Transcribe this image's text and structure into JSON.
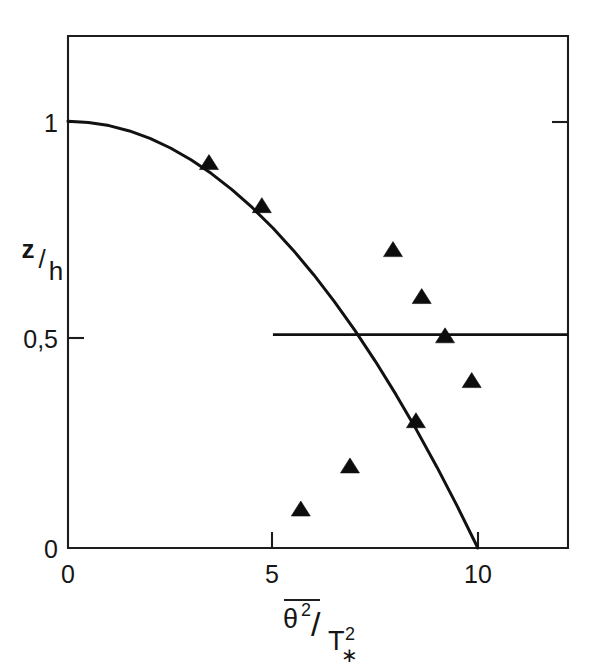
{
  "figure": {
    "background_color": "#ffffff",
    "ink_color": "#111111",
    "frame": {
      "left_px": 68,
      "right_px": 568,
      "top_px": 36,
      "bottom_px": 548
    }
  },
  "axes": {
    "y": {
      "label_numerator": "z",
      "label_slash": "/",
      "label_denominator": "h",
      "tick_labels": [
        "1",
        "0,5",
        "0"
      ],
      "tick_values": [
        1,
        0.5,
        0
      ],
      "range": [
        0,
        1.2
      ]
    },
    "x": {
      "label_numerator": "θ",
      "label_numerator_exponent": "2",
      "label_slash": "/",
      "label_denominator": "T",
      "label_denominator_subscript": "∗",
      "label_denominator_exponent": "2",
      "label_overbar": true,
      "tick_labels": [
        "0",
        "5",
        "10"
      ],
      "tick_values": [
        0,
        5,
        10
      ],
      "range": [
        0,
        12.2
      ]
    }
  },
  "chart_data": {
    "type": "scatter",
    "title": "",
    "subtitle": "",
    "xlabel": "θ̅² / T∗²",
    "ylabel": "z/h",
    "xlim": [
      0,
      12.2
    ],
    "ylim": [
      0,
      1.2
    ],
    "xticks": [
      0,
      5,
      10
    ],
    "xticklabels": [
      "0",
      "5",
      "10"
    ],
    "yticks": [
      0,
      0.5,
      1
    ],
    "yticklabels": [
      "0",
      "0,5",
      "1"
    ],
    "grid": false,
    "legend": "none",
    "series": [
      {
        "name": "measurements",
        "type": "scatter",
        "marker": "triangle-up",
        "marker_color": "#0d0d0d",
        "x": [
          3.44,
          4.73,
          7.93,
          8.63,
          9.2,
          9.85,
          8.49,
          6.88,
          5.68
        ],
        "y": [
          0.901,
          0.8,
          0.697,
          0.587,
          0.495,
          0.39,
          0.296,
          0.19,
          0.089
        ]
      },
      {
        "name": "model-curve",
        "type": "line",
        "line_color": "#111111",
        "expression": "z/h = 1 - (x/10)^2",
        "x": [
          0,
          0.5,
          1,
          1.5,
          2,
          2.5,
          3,
          3.5,
          4,
          4.5,
          5,
          5.5,
          6,
          6.5,
          7,
          7.5,
          8,
          8.5,
          9,
          9.5,
          10
        ],
        "y": [
          1.0,
          0.9975,
          0.99,
          0.9775,
          0.96,
          0.9375,
          0.91,
          0.8775,
          0.84,
          0.7975,
          0.75,
          0.6975,
          0.64,
          0.5775,
          0.51,
          0.4375,
          0.36,
          0.2775,
          0.19,
          0.0975,
          0.0
        ]
      },
      {
        "name": "reference-line-half",
        "type": "line",
        "line_color": "#111111",
        "x": [
          5,
          12.2
        ],
        "y": [
          0.5,
          0.5
        ]
      }
    ],
    "annotations": []
  }
}
